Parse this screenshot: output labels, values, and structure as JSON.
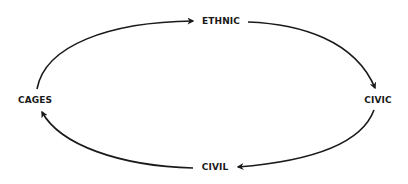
{
  "diagram": {
    "type": "cycle",
    "nodes": [
      {
        "id": "ethnic",
        "label": "ETHNIC"
      },
      {
        "id": "civic",
        "label": "CIVIC"
      },
      {
        "id": "civil",
        "label": "CIVIL"
      },
      {
        "id": "cages",
        "label": "CAGES"
      }
    ],
    "edges": [
      {
        "from": "cages",
        "to": "ethnic"
      },
      {
        "from": "ethnic",
        "to": "civic"
      },
      {
        "from": "civic",
        "to": "civil"
      },
      {
        "from": "civil",
        "to": "cages"
      }
    ],
    "colors": {
      "line": "#1a1a1a",
      "text": "#1a1a1a",
      "background": "#ffffff"
    }
  }
}
